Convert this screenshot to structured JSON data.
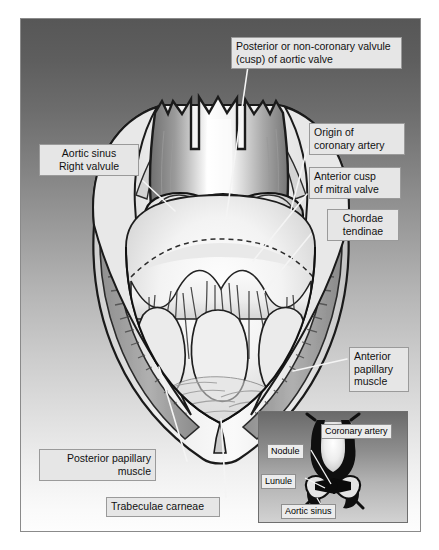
{
  "figure": {
    "background_top_color": "#575757",
    "background_bottom_color": "#fdfdfd",
    "frame_border_color": "#8a8a8a",
    "label_fill_color": "#e6e6e6",
    "label_border_color": "#9a9a9a",
    "leader_line_color": "#f2f2f2"
  },
  "labels": [
    {
      "id": "posterior-cusp",
      "text": "Posterior or non-coronary valvule\n(cusp) of aortic valve"
    },
    {
      "id": "aortic-sinus-right-valvule",
      "text": "Aortic sinus\nRight valvule"
    },
    {
      "id": "origin-coronary-artery",
      "text": "Origin of\ncoronary artery"
    },
    {
      "id": "anterior-cusp-mitral",
      "text": "Anterior cusp\nof mitral valve"
    },
    {
      "id": "chordae-tendinae",
      "text": "Chordae\ntendinae"
    },
    {
      "id": "anterior-papillary-muscle",
      "text": "Anterior\npapillary\nmuscle"
    },
    {
      "id": "posterior-papillary-muscle",
      "text": "Posterior papillary\nmuscle"
    },
    {
      "id": "trabeculae-carneae",
      "text": "Trabeculae carneae"
    }
  ],
  "inset": {
    "title": "Aortic valve cusp detail",
    "labels": [
      {
        "id": "coronary-artery",
        "text": "Coronary artery"
      },
      {
        "id": "nodule",
        "text": "Nodule"
      },
      {
        "id": "lunule",
        "text": "Lunule"
      },
      {
        "id": "aortic-sinus",
        "text": "Aortic sinus"
      }
    ]
  }
}
